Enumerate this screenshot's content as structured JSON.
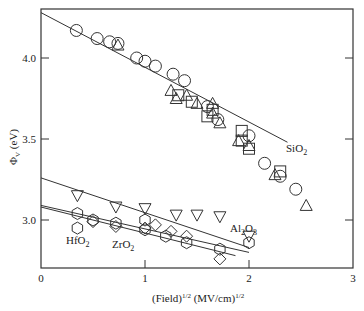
{
  "chart_data": {
    "type": "scatter",
    "title": "",
    "xlabel": "(Field)^1/2 (MV/cm)^1/2",
    "ylabel": "ΦV (eV)",
    "xlim": [
      0,
      3
    ],
    "ylim": [
      2.7,
      4.32
    ],
    "xticks": [
      "0",
      "1",
      "2",
      "3"
    ],
    "yticks": [
      "3.0",
      "3.5",
      "4.0"
    ],
    "grid": false,
    "legend": null,
    "annotations": [
      "SiO2",
      "Al2O3",
      "HfO2",
      "ZrO2"
    ],
    "fit_lines": [
      {
        "name": "SiO2",
        "x": [
          0,
          2.37
        ],
        "y": [
          4.28,
          3.48
        ]
      },
      {
        "name": "Al2O3",
        "x": [
          0,
          2.0
        ],
        "y": [
          3.26,
          2.83
        ]
      },
      {
        "name": "HfO2",
        "x": [
          0,
          2.0
        ],
        "y": [
          3.09,
          2.8
        ]
      },
      {
        "name": "ZrO2",
        "x": [
          0,
          1.87
        ],
        "y": [
          3.08,
          2.78
        ]
      }
    ],
    "series": [
      {
        "name": "SiO2 (circles)",
        "marker": "circle",
        "x": [
          0.34,
          0.54,
          0.66,
          0.74,
          0.92,
          1.0,
          1.1,
          1.27,
          1.38,
          1.6,
          1.7,
          2.0,
          2.15,
          2.3,
          2.45
        ],
        "y": [
          4.17,
          4.12,
          4.1,
          4.09,
          4.0,
          3.98,
          3.95,
          3.9,
          3.86,
          3.7,
          3.62,
          3.52,
          3.35,
          3.27,
          3.19
        ]
      },
      {
        "name": "SiO2 (triangles)",
        "marker": "triangle-up",
        "x": [
          0.74,
          1.25,
          1.3,
          1.4,
          1.5,
          1.65,
          1.65,
          1.72,
          1.9,
          2.0,
          2.25,
          2.55
        ],
        "y": [
          4.08,
          3.8,
          3.75,
          3.77,
          3.72,
          3.72,
          3.66,
          3.6,
          3.49,
          3.46,
          3.28,
          3.09
        ]
      },
      {
        "name": "SiO2 (squares)",
        "marker": "square",
        "x": [
          1.32,
          1.45,
          1.6,
          1.65,
          1.93,
          1.93,
          2.0,
          2.3
        ],
        "y": [
          3.77,
          3.73,
          3.64,
          3.68,
          3.55,
          3.49,
          3.44,
          3.3
        ]
      },
      {
        "name": "Al2O3 (inverted triangles)",
        "marker": "triangle-down",
        "x": [
          0.35,
          0.72,
          1.0,
          1.3,
          1.5,
          1.72,
          2.0
        ],
        "y": [
          3.15,
          3.08,
          3.07,
          3.03,
          3.03,
          3.02,
          2.9
        ]
      },
      {
        "name": "HfO2 (hexagons)",
        "marker": "hexagon",
        "x": [
          0.35,
          0.35,
          0.5,
          0.72,
          1.0,
          1.0,
          1.2,
          1.4,
          1.72,
          2.0
        ],
        "y": [
          3.04,
          2.95,
          3.0,
          2.98,
          3.0,
          2.94,
          2.9,
          2.86,
          2.82,
          2.86
        ]
      },
      {
        "name": "ZrO2 (diamonds)",
        "marker": "diamond",
        "x": [
          0.5,
          0.72,
          1.0,
          1.1,
          1.25,
          1.4,
          1.72
        ],
        "y": [
          2.99,
          2.96,
          2.95,
          2.97,
          2.93,
          2.9,
          2.76
        ]
      }
    ]
  },
  "labels": {
    "xlabel_main": "(Field)",
    "xlabel_sup1": "1/2",
    "xlabel_unit": " (MV/cm)",
    "xlabel_sup2": "1/2",
    "ylabel_phi": "Φ",
    "ylabel_sub": "V",
    "ylabel_unit": " (eV)",
    "sio2": "SiO",
    "al2o3_a": "Al",
    "al2o3_b": "O",
    "hfo2": "HfO",
    "zro2": "ZrO",
    "sub2": "2",
    "sub3": "3"
  }
}
